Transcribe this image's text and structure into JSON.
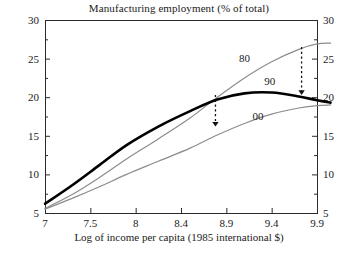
{
  "chart_data": {
    "type": "line",
    "title": "Manufacturing employment (% of total)",
    "xlabel": "Log of income per capita (1985 international $)",
    "ylabel": "",
    "xlim": [
      7,
      10.05
    ],
    "ylim": [
      5,
      30
    ],
    "grid": false,
    "legend": "inline-curve-labels",
    "xticks": [
      "7",
      "7.5",
      "8",
      "8.4",
      "8.9",
      "9.4",
      "9.9"
    ],
    "xtick_values": [
      7,
      7.5,
      8,
      8.4,
      8.9,
      9.4,
      9.9
    ],
    "yticks": [
      "5",
      "10",
      "15",
      "20",
      "25",
      "30"
    ],
    "ytick_values": [
      5,
      10,
      15,
      20,
      25,
      30
    ],
    "yticks_right": [
      "5",
      "10",
      "15",
      "20",
      "25",
      "30"
    ],
    "minor_ticks": true,
    "series": [
      {
        "name": "80",
        "label": "80",
        "color": "#8c8c8c",
        "width": 1.2,
        "x": [
          7.0,
          7.3,
          7.6,
          7.9,
          8.2,
          8.5,
          8.8,
          9.1,
          9.4,
          9.7,
          9.9,
          10.05
        ],
        "values": [
          5.6,
          7.4,
          9.6,
          12.0,
          14.6,
          17.3,
          20.0,
          22.5,
          24.6,
          26.2,
          26.9,
          27.0
        ]
      },
      {
        "name": "90",
        "label": "90",
        "color": "#000000",
        "width": 2.6,
        "x": [
          7.0,
          7.3,
          7.6,
          7.9,
          8.2,
          8.5,
          8.8,
          9.1,
          9.4,
          9.7,
          9.9,
          10.05
        ],
        "values": [
          6.2,
          8.6,
          11.2,
          13.8,
          16.2,
          18.2,
          19.7,
          20.5,
          20.6,
          20.1,
          19.6,
          19.3
        ]
      },
      {
        "name": "00",
        "label": "00",
        "color": "#8c8c8c",
        "width": 1.2,
        "x": [
          7.0,
          7.3,
          7.6,
          7.9,
          8.2,
          8.5,
          8.8,
          9.1,
          9.4,
          9.7,
          9.9,
          10.05
        ],
        "values": [
          5.5,
          6.9,
          8.4,
          10.0,
          11.7,
          13.4,
          15.1,
          16.6,
          17.8,
          18.6,
          18.9,
          19.0
        ]
      }
    ],
    "annotations": [
      {
        "name": "arrow-90-to-00",
        "type": "dashed-arrow",
        "direction": "down",
        "x": 8.78,
        "y_start": 20.3,
        "y_end": 16.2
      },
      {
        "name": "arrow-80-to-90",
        "type": "dashed-arrow",
        "direction": "down",
        "x": 9.73,
        "y_start": 26.5,
        "y_end": 20.3
      }
    ],
    "curve_labels": [
      {
        "text": "80",
        "x": 9.1,
        "y": 24.6
      },
      {
        "text": "90",
        "x": 9.38,
        "y": 21.6
      },
      {
        "text": "00",
        "x": 9.25,
        "y": 17.1
      }
    ]
  }
}
